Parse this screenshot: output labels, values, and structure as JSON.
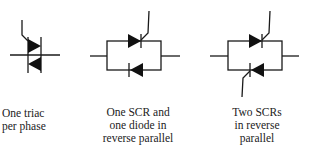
{
  "figures": [
    {
      "id": "triac",
      "caption": [
        "One triac",
        "per phase"
      ]
    },
    {
      "id": "scr-diode",
      "caption": [
        "One SCR and",
        "one diode in",
        "reverse parallel"
      ]
    },
    {
      "id": "two-scrs",
      "caption": [
        "Two SCRs",
        "in reverse",
        "parallel"
      ]
    }
  ],
  "colors": {
    "ink": "#111111",
    "background": "#ffffff"
  }
}
